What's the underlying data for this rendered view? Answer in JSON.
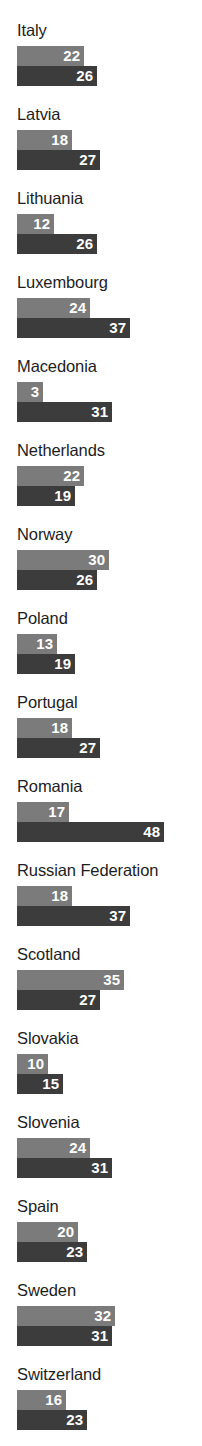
{
  "chart_data": {
    "type": "bar",
    "orientation": "horizontal",
    "title": "",
    "subtitle": "",
    "xlabel": "",
    "ylabel": "",
    "grid": false,
    "legend": [],
    "axis_visible": false,
    "xlim": [
      0,
      48
    ],
    "categories": [
      "Italy",
      "Latvia",
      "Lithuania",
      "Luxembourg",
      "Macedonia",
      "Netherlands",
      "Norway",
      "Poland",
      "Portugal",
      "Romania",
      "Russian Federation",
      "Scotland",
      "Slovakia",
      "Slovenia",
      "Spain",
      "Sweden",
      "Switzerland",
      "Ukraine",
      "Wales"
    ],
    "series": [
      {
        "name": "series-light",
        "color": "#7b7b7b",
        "values": [
          22,
          18,
          12,
          24,
          3,
          22,
          30,
          13,
          18,
          17,
          18,
          35,
          10,
          24,
          20,
          32,
          16,
          17,
          39
        ]
      },
      {
        "name": "series-dark",
        "color": "#3c3c3c",
        "values": [
          26,
          27,
          26,
          37,
          31,
          19,
          26,
          19,
          27,
          48,
          37,
          27,
          15,
          31,
          23,
          31,
          23,
          40,
          29
        ]
      }
    ]
  },
  "rows": [
    {
      "label": "Italy",
      "light": 22,
      "dark": 26
    },
    {
      "label": "Latvia",
      "light": 18,
      "dark": 27
    },
    {
      "label": "Lithuania",
      "light": 12,
      "dark": 26
    },
    {
      "label": "Luxembourg",
      "light": 24,
      "dark": 37
    },
    {
      "label": "Macedonia",
      "light": 3,
      "dark": 31
    },
    {
      "label": "Netherlands",
      "light": 22,
      "dark": 19
    },
    {
      "label": "Norway",
      "light": 30,
      "dark": 26
    },
    {
      "label": "Poland",
      "light": 13,
      "dark": 19
    },
    {
      "label": "Portugal",
      "light": 18,
      "dark": 27
    },
    {
      "label": "Romania",
      "light": 17,
      "dark": 48
    },
    {
      "label": "Russian Federation",
      "light": 18,
      "dark": 37
    },
    {
      "label": "Scotland",
      "light": 35,
      "dark": 27
    },
    {
      "label": "Slovakia",
      "light": 10,
      "dark": 15
    },
    {
      "label": "Slovenia",
      "light": 24,
      "dark": 31
    },
    {
      "label": "Spain",
      "light": 20,
      "dark": 23
    },
    {
      "label": "Sweden",
      "light": 32,
      "dark": 31
    },
    {
      "label": "Switzerland",
      "light": 16,
      "dark": 23
    },
    {
      "label": "Ukraine",
      "light": 17,
      "dark": 40
    },
    {
      "label": "Wales",
      "light": 39,
      "dark": 29
    }
  ],
  "layout": {
    "bar_origin_x": 17,
    "px_per_unit": 3.06,
    "min_bar_px": 26,
    "row_pitch": 84,
    "first_row_top": 20,
    "bar_height": 20,
    "label_offset": 26
  },
  "colors": {
    "light_bar": "#7b7b7b",
    "dark_bar": "#3c3c3c",
    "text": "#1d1d1d",
    "value_text": "#ffffff",
    "background": "#ffffff"
  }
}
